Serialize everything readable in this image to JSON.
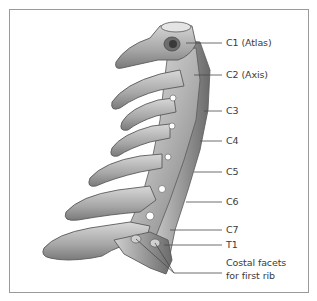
{
  "figure": {
    "colors": {
      "bone_light": "#d6d6d6",
      "bone_mid": "#a8a8a8",
      "bone_dark": "#6e6e6e",
      "outline": "#5a5a5a",
      "leader_line": "#4a4a4a",
      "label_text": "#3a3a3a",
      "border": "#9a9a9a"
    }
  },
  "labels": [
    {
      "id": "c1",
      "text": "C1 (Atlas)",
      "x": 226,
      "y": 38
    },
    {
      "id": "c2",
      "text": "C2 (Axis)",
      "x": 226,
      "y": 70
    },
    {
      "id": "c3",
      "text": "C3",
      "x": 226,
      "y": 106
    },
    {
      "id": "c4",
      "text": "C4",
      "x": 226,
      "y": 136
    },
    {
      "id": "c5",
      "text": "C5",
      "x": 226,
      "y": 167
    },
    {
      "id": "c6",
      "text": "C6",
      "x": 226,
      "y": 197
    },
    {
      "id": "c7",
      "text": "C7",
      "x": 226,
      "y": 225
    },
    {
      "id": "t1",
      "text": "T1",
      "x": 226,
      "y": 240
    },
    {
      "id": "facets_line1",
      "text": "Costal facets",
      "x": 226,
      "y": 259
    },
    {
      "id": "facets_line2",
      "text": "for first rib",
      "x": 226,
      "y": 271
    }
  ]
}
